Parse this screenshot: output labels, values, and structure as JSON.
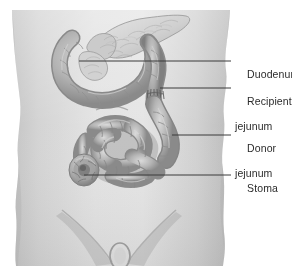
{
  "figure": {
    "type": "medical-illustration",
    "view": "anterior abdominal torso, grayscale",
    "background_color": "#ffffff",
    "body_fill_color": "#d8d8d8",
    "body_shadow_color": "#b4b4b4",
    "organ_fill_color": "#b9b9b9",
    "organ_shade_color": "#8f8f8f",
    "organ_highlight_color": "#d6d6d6",
    "pancreas_color": "#dcdcdc",
    "leader_line_color": "#3a3a3a",
    "text_color": "#2b2b2b"
  },
  "labels": [
    {
      "id": "duodenum",
      "line1": "Duodenum",
      "line2": "",
      "text_x": 235,
      "text_y": 55,
      "leader": {
        "x1": 79,
        "y1": 61,
        "x2": 231,
        "y2": 61
      }
    },
    {
      "id": "recipient-jejunum",
      "line1": "Recipient",
      "line2": "jejunum",
      "text_x": 235,
      "text_y": 82,
      "leader": {
        "x1": 160,
        "y1": 88,
        "x2": 231,
        "y2": 88
      }
    },
    {
      "id": "donor-jejunum",
      "line1": "Donor",
      "line2": "jejunum",
      "text_x": 235,
      "text_y": 129,
      "leader": {
        "x1": 172,
        "y1": 135,
        "x2": 231,
        "y2": 135
      }
    },
    {
      "id": "stoma",
      "line1": "Stoma",
      "line2": "",
      "text_x": 235,
      "text_y": 169,
      "leader": {
        "x1": 84,
        "y1": 175,
        "x2": 231,
        "y2": 175
      }
    }
  ],
  "anatomy_parts": [
    {
      "id": "torso",
      "name": "abdominal torso silhouette"
    },
    {
      "id": "duodenum",
      "name": "duodenal C-loop"
    },
    {
      "id": "pancreas",
      "name": "pancreas with lobulated texture"
    },
    {
      "id": "recipient-jejunum",
      "name": "recipient jejunum limb with anastomosis sutures"
    },
    {
      "id": "donor-jejunum",
      "name": "donor jejunum descending limb"
    },
    {
      "id": "bowel-loops",
      "name": "coiled small bowel loops"
    },
    {
      "id": "stoma",
      "name": "stoma bud at abdominal wall"
    },
    {
      "id": "umbilicus",
      "name": "umbilicus"
    },
    {
      "id": "pelvic-contour",
      "name": "inguinal and pelvic contour shading"
    }
  ]
}
